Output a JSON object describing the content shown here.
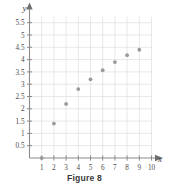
{
  "figure": {
    "caption": "Figure 8"
  },
  "chart_data": {
    "type": "scatter",
    "title": "",
    "xlabel": "x",
    "ylabel": "y",
    "x": [
      1,
      2,
      3,
      4,
      5,
      6,
      7,
      8,
      9
    ],
    "values": [
      0,
      1.4,
      2.2,
      2.8,
      3.2,
      3.57,
      3.9,
      4.18,
      4.4
    ],
    "series": [
      {
        "name": "data",
        "points": [
          {
            "x": 1,
            "y": 0
          },
          {
            "x": 2,
            "y": 1.4
          },
          {
            "x": 3,
            "y": 2.2
          },
          {
            "x": 4,
            "y": 2.8
          },
          {
            "x": 5,
            "y": 3.2
          },
          {
            "x": 6,
            "y": 3.57
          },
          {
            "x": 7,
            "y": 3.9
          },
          {
            "x": 8,
            "y": 4.18
          },
          {
            "x": 9,
            "y": 4.4
          }
        ],
        "marker_color": "#9a9a9a"
      }
    ],
    "xlim": [
      0,
      10.4
    ],
    "ylim": [
      0,
      5.8
    ],
    "xticks": [
      1,
      2,
      3,
      4,
      5,
      6,
      7,
      8,
      9,
      10
    ],
    "xtick_labels": [
      "1",
      "2",
      "3",
      "4",
      "5",
      "6",
      "7",
      "8",
      "9",
      "10"
    ],
    "yticks": [
      0.5,
      1,
      1.5,
      2,
      2.5,
      3,
      3.5,
      4,
      4.5,
      5,
      5.5
    ],
    "ytick_labels": [
      "0.5",
      "1",
      "1.5",
      "2",
      "2.5",
      "3",
      "3.5",
      "4",
      "4.5",
      "5",
      "5.5"
    ],
    "grid": true,
    "grid_color": "#d9d9d9",
    "axis_color": "#8a8a8a",
    "legend": "none"
  }
}
